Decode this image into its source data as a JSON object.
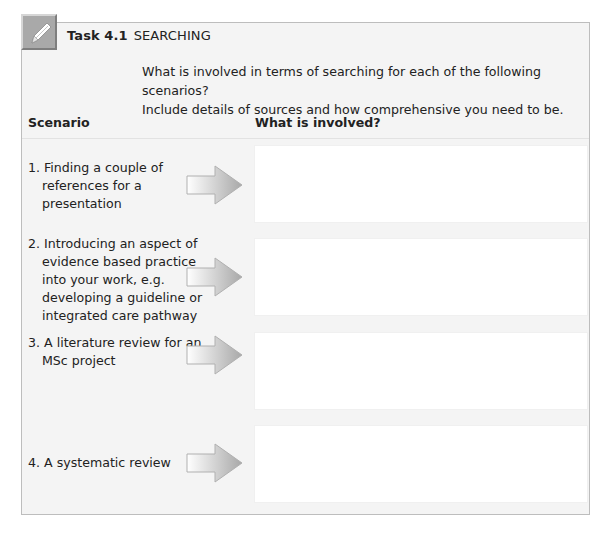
{
  "task": {
    "number_label": "Task 4.1",
    "title": "SEARCHING",
    "icon": "pencil-icon"
  },
  "intro": {
    "line1": "What is involved in terms of searching for each of the following scenarios?",
    "line2": "Include details of sources and how comprehensive you need to be."
  },
  "columns": {
    "scenario": "Scenario",
    "involved": "What is involved?"
  },
  "rows": [
    {
      "text": "1. Finding a couple of references for a presentation",
      "answer": ""
    },
    {
      "text": "2. Introducing an aspect of evidence based practice into your work, e.g. developing a guideline or integrated care pathway",
      "answer": ""
    },
    {
      "text": "3. A literature review for an MSc project",
      "answer": ""
    },
    {
      "text": "4. A systematic review",
      "answer": ""
    }
  ],
  "colors": {
    "frame_border": "#bdbdbd",
    "frame_bg": "#f4f4f4",
    "icon_bg": "#a9a9a9",
    "arrow_light": "#ffffff",
    "arrow_dark": "#a8a8a8",
    "answer_bg": "#ffffff"
  }
}
